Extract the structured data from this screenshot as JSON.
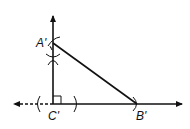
{
  "diagram": {
    "colors": {
      "stroke": "#111111",
      "background": "#ffffff"
    },
    "points": {
      "A": {
        "label": "A'"
      },
      "B": {
        "label": "B'"
      },
      "C": {
        "label": "C'"
      }
    },
    "marks": {
      "right_angle_at": "C'",
      "construction_arcs": [
        "arc-left-of-C",
        "arc-right-of-C",
        "arc-cross-on-vertical",
        "arc-at-A",
        "arc-at-B"
      ]
    }
  }
}
